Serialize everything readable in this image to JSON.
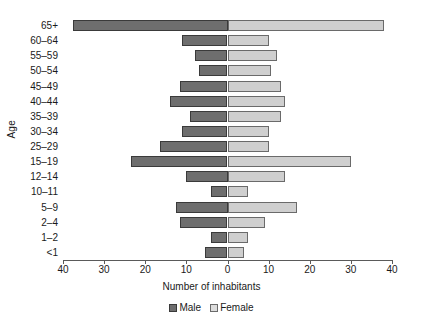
{
  "chart_data": {
    "type": "bar",
    "subtype": "population-pyramid",
    "title": "",
    "xlabel": "Number of inhabitants",
    "ylabel": "Age",
    "categories": [
      "65+",
      "60–64",
      "55–59",
      "50–54",
      "45–49",
      "40–44",
      "35–39",
      "30–34",
      "25–29",
      "15–19",
      "12–14",
      "10–11",
      "5–9",
      "2–4",
      "1–2",
      "<1"
    ],
    "series": [
      {
        "name": "Male",
        "side": "left",
        "color": "#6e6e6e",
        "values": [
          37.5,
          11,
          8,
          7,
          11.5,
          14,
          9,
          11,
          16.5,
          23.5,
          10,
          4,
          12.5,
          11.5,
          4,
          5.5
        ]
      },
      {
        "name": "Female",
        "side": "right",
        "color": "#cfcfcf",
        "values": [
          38,
          10,
          12,
          10.5,
          13,
          14,
          13,
          10,
          10,
          30,
          14,
          5,
          17,
          9,
          5,
          4
        ]
      }
    ],
    "xlim": [
      -40,
      40
    ],
    "xticks": [
      -40,
      -30,
      -20,
      -10,
      0,
      10,
      20,
      30,
      40
    ],
    "xtick_labels": [
      "40",
      "30",
      "20",
      "10",
      "0",
      "10",
      "20",
      "30",
      "40"
    ],
    "grid": false,
    "legend_position": "bottom",
    "legend": [
      "Male",
      "Female"
    ]
  },
  "axes": {
    "y_title": "Age",
    "x_title": "Number of inhabitants"
  }
}
